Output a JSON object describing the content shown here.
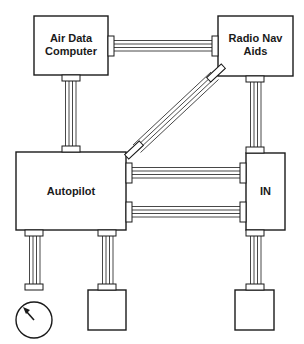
{
  "diagram": {
    "type": "block-diagram",
    "colors": {
      "stroke": "#1a1a1a",
      "background": "#ffffff"
    },
    "nodes": [
      {
        "id": "air-data-computer",
        "label_line1": "Air Data",
        "label_line2": "Computer"
      },
      {
        "id": "radio-nav-aids",
        "label_line1": "Radio Nav",
        "label_line2": "Aids"
      },
      {
        "id": "autopilot",
        "label": "Autopilot"
      },
      {
        "id": "in",
        "label": "IN"
      },
      {
        "id": "gauge",
        "label": ""
      },
      {
        "id": "autopilot-output-box",
        "label": ""
      },
      {
        "id": "in-output-box",
        "label": ""
      }
    ],
    "connections": [
      {
        "from": "air-data-computer",
        "to": "radio-nav-aids"
      },
      {
        "from": "air-data-computer",
        "to": "autopilot"
      },
      {
        "from": "radio-nav-aids",
        "to": "autopilot"
      },
      {
        "from": "radio-nav-aids",
        "to": "in"
      },
      {
        "from": "autopilot",
        "to": "in",
        "count": 2
      },
      {
        "from": "autopilot",
        "to": "gauge"
      },
      {
        "from": "autopilot",
        "to": "autopilot-output-box"
      },
      {
        "from": "in",
        "to": "in-output-box"
      }
    ]
  }
}
